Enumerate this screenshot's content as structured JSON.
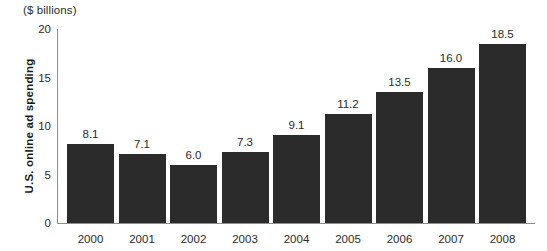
{
  "chart_data": {
    "type": "bar",
    "title": "",
    "unit_caption": "($ billions)",
    "xlabel": "",
    "ylabel": "U.S. online ad spending",
    "categories": [
      "2000",
      "2001",
      "2002",
      "2003",
      "2004",
      "2005",
      "2006",
      "2007",
      "2008"
    ],
    "values": [
      8.1,
      7.1,
      6.0,
      7.3,
      9.1,
      11.2,
      13.5,
      16.0,
      18.5
    ],
    "value_labels": [
      "8.1",
      "7.1",
      "6.0",
      "7.3",
      "9.1",
      "11.2",
      "13.5",
      "16.0",
      "18.5"
    ],
    "ylim": [
      0,
      20
    ],
    "yticks": [
      0,
      5,
      10,
      15,
      20
    ],
    "ytick_labels": [
      "0",
      "5",
      "10",
      "15",
      "20"
    ],
    "grid": false,
    "legend": false,
    "bar_color": "#2b2b2b",
    "axis_color": "#8e8e8e",
    "text_color": "#2b2b2b"
  }
}
